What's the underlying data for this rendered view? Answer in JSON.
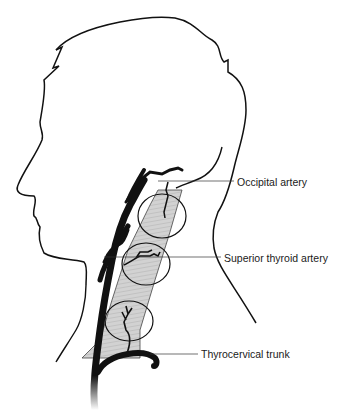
{
  "figure": {
    "stroke_color": "#111111",
    "esophagus_fill": "#cfcfcf",
    "background": "#ffffff"
  },
  "labels": [
    {
      "id": "occipital",
      "text": "Occipital artery"
    },
    {
      "id": "superior-thyroid",
      "text": "Superior thyroid artery"
    },
    {
      "id": "thyrocervical",
      "text": "Thyrocervical trunk"
    }
  ]
}
